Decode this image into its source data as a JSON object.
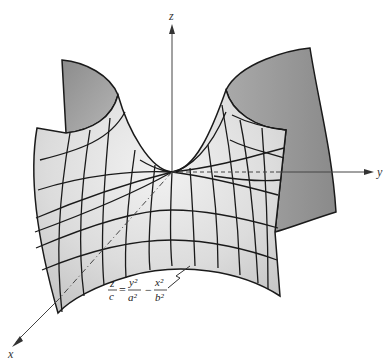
{
  "figure": {
    "equation": {
      "lhs_num": "z",
      "lhs_den": "c",
      "equals": "=",
      "term1_num": "y²",
      "term1_den": "a²",
      "minus": "−",
      "term2_num": "x²",
      "term2_den": "b²"
    },
    "axes": {
      "x": "x",
      "y": "y",
      "z": "z"
    },
    "colors": {
      "surface_light": "#e6e6e6",
      "surface_mid": "#cfcfcf",
      "surface_dark": "#9a9a9a",
      "grid_line": "#1a1a1a",
      "axis_line": "#444444"
    }
  }
}
